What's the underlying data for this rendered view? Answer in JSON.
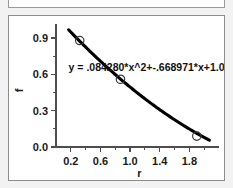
{
  "window": {
    "background_color": "#f2f2f2",
    "panel_background": "#ffffff",
    "border_color": "#8c8c8c"
  },
  "toolbar": {
    "label": ""
  },
  "chart_data": {
    "type": "scatter",
    "title": "",
    "subtitle": "",
    "xlabel": "r",
    "ylabel": "f",
    "xlim": [
      0.0,
      2.2
    ],
    "ylim": [
      0.0,
      1.0
    ],
    "grid": false,
    "legend": null,
    "x_ticks": [
      0.2,
      0.6,
      1.0,
      1.4,
      1.8
    ],
    "x_tick_labels": [
      "0.2",
      "0.6",
      "1.0",
      "1.4",
      "1.8"
    ],
    "x_minor_ticks": [
      0.4,
      0.8,
      1.2,
      1.6,
      2.0
    ],
    "y_ticks": [
      0.0,
      0.3,
      0.6,
      0.9
    ],
    "y_tick_labels": [
      "0.0",
      "0.3",
      "0.6",
      "0.9"
    ],
    "y_minor_ticks": [
      0.15,
      0.45,
      0.75
    ],
    "marker_style": "open-circle",
    "curve_color": "#000000",
    "marker_color": "#3b3b3b",
    "points": [
      {
        "x": 0.32,
        "y": 0.88
      },
      {
        "x": 0.87,
        "y": 0.56
      },
      {
        "x": 1.9,
        "y": 0.09
      }
    ],
    "series": [
      {
        "name": "data",
        "x": [
          0.32,
          0.87,
          1.9
        ],
        "values": [
          0.88,
          0.56,
          0.09
        ]
      }
    ],
    "fit": {
      "type": "quadratic",
      "a": 0.08428,
      "b": -0.668971,
      "c": 1.08,
      "x_start": 0.17,
      "x_end": 2.07
    },
    "annotations": [
      {
        "name": "fit-equation",
        "text": "y = .084280*x^2+-.668971*x+1.08",
        "x": 0.17,
        "y": 0.625
      }
    ]
  }
}
